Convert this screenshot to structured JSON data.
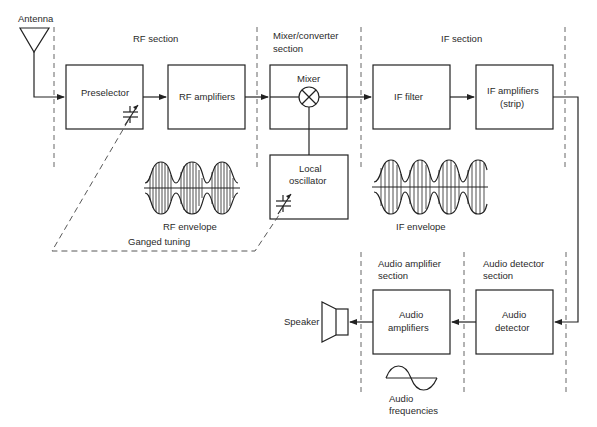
{
  "diagram": {
    "sections": {
      "rf": "RF section",
      "mixer_line1": "Mixer/converter",
      "mixer_line2": "section",
      "if": "IF section",
      "audio_amp_line1": "Audio amplifier",
      "audio_amp_line2": "section",
      "audio_det_line1": "Audio detector",
      "audio_det_line2": "section"
    },
    "blocks": {
      "antenna": "Antenna",
      "preselector": "Preselector",
      "rf_amplifiers": "RF amplifiers",
      "mixer": "Mixer",
      "local_osc_line1": "Local",
      "local_osc_line2": "oscillator",
      "if_filter": "IF filter",
      "if_amps_line1": "IF amplifiers",
      "if_amps_line2": "(strip)",
      "audio_detector_line1": "Audio",
      "audio_detector_line2": "detector",
      "audio_amps_line1": "Audio",
      "audio_amps_line2": "amplifiers",
      "speaker": "Speaker"
    },
    "annotations": {
      "rf_envelope": "RF envelope",
      "if_envelope": "IF envelope",
      "ganged_tuning": "Ganged tuning",
      "audio_freq_line1": "Audio",
      "audio_freq_line2": "frequencies"
    },
    "icons": [
      "antenna-icon",
      "variable-capacitor-icon",
      "mixer-multiply-icon",
      "speaker-icon",
      "sine-wave-icon",
      "am-envelope-icon"
    ],
    "colors": {
      "line": "#222222",
      "text": "#2a2a2a",
      "background": "#ffffff"
    }
  }
}
